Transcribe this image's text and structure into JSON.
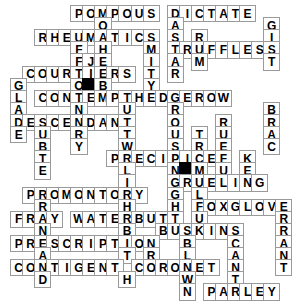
{
  "puzzle": {
    "title": "Crossword Grid",
    "columns": 16,
    "rows": 17,
    "cell_size": 17.3,
    "origin_x": 15,
    "origin_y": 10,
    "colors": {
      "cell_fill": "#ffffff",
      "cell_border": "#9a9a9a",
      "block_fill": "#000000",
      "letter": "#000000",
      "page_background": "#ffffff"
    },
    "across_entries": [
      {
        "answer": "POMPOUS",
        "row": 0,
        "col": 5
      },
      {
        "answer": "DICTATE",
        "row": 0,
        "col": 9
      },
      {
        "answer": "RHEUMATICS",
        "row": 2,
        "col": 2
      },
      {
        "answer": "TRUFFLES",
        "row": 4,
        "col": 9
      },
      {
        "answer": "COURTIERS",
        "row": 6,
        "col": 1
      },
      {
        "answer": "HEDGEROW",
        "row": 7,
        "col": 8
      },
      {
        "answer": "CONTEMPT",
        "row": 8,
        "col": 2
      },
      {
        "answer": "DESCENDANT",
        "row": 10,
        "col": 0
      },
      {
        "answer": "PRECIPICE",
        "row": 11,
        "col": 6
      },
      {
        "answer": "GRUELING",
        "row": 13,
        "col": 10
      },
      {
        "answer": "PROMONTORY",
        "row": 14,
        "col": 1
      },
      {
        "answer": "FOXGLOVE",
        "row": 15,
        "col": 8
      },
      {
        "answer": "FRAY",
        "row": 16,
        "col": 0
      },
      {
        "answer": "WATERBUTT",
        "row": 16,
        "col": 5
      },
      {
        "answer": "BUSKINS",
        "row": 17,
        "col": 6
      },
      {
        "answer": "PRESCRIPTION",
        "row": 18,
        "col": 0
      },
      {
        "answer": "CONTIGENT",
        "row": 20,
        "col": 0
      },
      {
        "answer": "CORONET",
        "row": 20,
        "col": 9
      },
      {
        "answer": "PARLEY",
        "row": 22,
        "col": 11
      }
    ],
    "down_entries": [
      {
        "answer": "POTHERS",
        "row": 0,
        "col": 6
      },
      {
        "answer": "DASTARD",
        "row": 0,
        "col": 9
      },
      {
        "answer": "FFORT",
        "row": 2,
        "col": 5
      },
      {
        "answer": "GIST",
        "row": 2,
        "col": 16
      },
      {
        "answer": "JET",
        "row": 4,
        "col": 7
      },
      {
        "answer": "ROUSTABOUT",
        "row": 3,
        "col": 11
      },
      {
        "answer": "GLADE",
        "row": 7,
        "col": 0
      },
      {
        "answer": "BRACKEN",
        "row": 9,
        "col": 16
      },
      {
        "answer": "TREMULOUS",
        "row": 10,
        "col": 12
      },
      {
        "answer": "RUEFUL",
        "row": 10,
        "col": 14
      },
      {
        "answer": "LIGHT",
        "row": 11,
        "col": 7
      },
      {
        "answer": "PROMONTORY",
        "row": 12,
        "col": 2
      },
      {
        "answer": "INHABITED",
        "row": 13,
        "col": 9
      },
      {
        "answer": "BLOWN",
        "row": 18,
        "col": 12
      },
      {
        "answer": "SCANTY",
        "row": 17,
        "col": 13
      },
      {
        "answer": "ERRANT",
        "row": 15,
        "col": 16
      }
    ],
    "cells": [
      {
        "r": 0,
        "c": 5,
        "t": "P"
      },
      {
        "r": 0,
        "c": 6,
        "t": "O"
      },
      {
        "r": 0,
        "c": 7,
        "t": "M"
      },
      {
        "r": 0,
        "c": 8,
        "t": "P"
      },
      {
        "r": 0,
        "c": 9,
        "t": "O"
      },
      {
        "r": 0,
        "c": 10,
        "t": "U"
      },
      {
        "r": 0,
        "c": 11,
        "t": "S"
      },
      {
        "r": 0,
        "c": 13,
        "t": "D"
      },
      {
        "r": 0,
        "c": 14,
        "t": "I"
      },
      {
        "r": 0,
        "c": 15,
        "t": "C"
      },
      {
        "r": 0,
        "c": 16,
        "t": "T"
      },
      {
        "r": 0,
        "c": 17,
        "t": "A"
      },
      {
        "r": 0,
        "c": 18,
        "t": "T"
      },
      {
        "r": 0,
        "c": 19,
        "t": "E"
      },
      {
        "r": 1,
        "c": 7,
        "t": "O"
      },
      {
        "r": 1,
        "c": 13,
        "t": "A"
      },
      {
        "r": 1,
        "c": 21,
        "t": "G"
      },
      {
        "r": 2,
        "c": 2,
        "t": "R"
      },
      {
        "r": 2,
        "c": 3,
        "t": "H"
      },
      {
        "r": 2,
        "c": 4,
        "t": "E"
      },
      {
        "r": 2,
        "c": 5,
        "t": "U"
      },
      {
        "r": 2,
        "c": 6,
        "t": "M"
      },
      {
        "r": 2,
        "c": 7,
        "t": "A"
      },
      {
        "r": 2,
        "c": 8,
        "t": "T"
      },
      {
        "r": 2,
        "c": 9,
        "t": "I"
      },
      {
        "r": 2,
        "c": 10,
        "t": "C"
      },
      {
        "r": 2,
        "c": 11,
        "t": "S"
      },
      {
        "r": 2,
        "c": 13,
        "t": "S"
      },
      {
        "r": 2,
        "c": 15,
        "t": "R"
      },
      {
        "r": 2,
        "c": 21,
        "t": "I"
      },
      {
        "r": 3,
        "c": 5,
        "t": "F"
      },
      {
        "r": 3,
        "c": 7,
        "t": "H"
      },
      {
        "r": 3,
        "c": 11,
        "t": "M"
      },
      {
        "r": 3,
        "c": 13,
        "t": "T"
      },
      {
        "r": 3,
        "c": 14,
        "t": "R"
      },
      {
        "r": 3,
        "c": 15,
        "t": "U"
      },
      {
        "r": 3,
        "c": 16,
        "t": "F"
      },
      {
        "r": 3,
        "c": 17,
        "t": "F"
      },
      {
        "r": 3,
        "c": 18,
        "t": "L"
      },
      {
        "r": 3,
        "c": 19,
        "t": "E"
      },
      {
        "r": 3,
        "c": 20,
        "t": "S"
      },
      {
        "r": 3,
        "c": 21,
        "t": "S"
      },
      {
        "r": 4,
        "c": 5,
        "t": "F"
      },
      {
        "r": 4,
        "c": 6,
        "t": "J"
      },
      {
        "r": 4,
        "c": 7,
        "t": "E"
      },
      {
        "r": 4,
        "c": 11,
        "t": "I"
      },
      {
        "r": 4,
        "c": 13,
        "t": "A"
      },
      {
        "r": 4,
        "c": 15,
        "t": "M"
      },
      {
        "r": 4,
        "c": 21,
        "t": "T"
      },
      {
        "r": 5,
        "c": 1,
        "t": "C"
      },
      {
        "r": 5,
        "c": 2,
        "t": "O"
      },
      {
        "r": 5,
        "c": 3,
        "t": "U"
      },
      {
        "r": 5,
        "c": 4,
        "t": "R"
      },
      {
        "r": 5,
        "c": 5,
        "t": "T"
      },
      {
        "r": 5,
        "c": 6,
        "t": "I"
      },
      {
        "r": 5,
        "c": 7,
        "t": "E"
      },
      {
        "r": 5,
        "c": 8,
        "t": "R"
      },
      {
        "r": 5,
        "c": 9,
        "t": "S"
      },
      {
        "r": 5,
        "c": 11,
        "t": "T"
      },
      {
        "r": 5,
        "c": 13,
        "t": "R"
      },
      {
        "r": 6,
        "c": 0,
        "t": "G"
      },
      {
        "r": 6,
        "c": 5,
        "t": "O"
      },
      {
        "r": 6,
        "c": 6,
        "t": "",
        "block": true
      },
      {
        "r": 6,
        "c": 7,
        "t": "B"
      },
      {
        "r": 6,
        "c": 11,
        "t": "Y"
      },
      {
        "r": 7,
        "c": 0,
        "t": "L"
      },
      {
        "r": 7,
        "c": 2,
        "t": "C"
      },
      {
        "r": 7,
        "c": 3,
        "t": "O"
      },
      {
        "r": 7,
        "c": 4,
        "t": "N"
      },
      {
        "r": 7,
        "c": 5,
        "t": "T"
      },
      {
        "r": 7,
        "c": 6,
        "t": "E"
      },
      {
        "r": 7,
        "c": 7,
        "t": "M"
      },
      {
        "r": 7,
        "c": 8,
        "t": "P"
      },
      {
        "r": 7,
        "c": 9,
        "t": "T"
      },
      {
        "r": 7,
        "c": 10,
        "t": "H"
      },
      {
        "r": 7,
        "c": 11,
        "t": "E"
      },
      {
        "r": 7,
        "c": 12,
        "t": "D"
      },
      {
        "r": 7,
        "c": 13,
        "t": "G"
      },
      {
        "r": 7,
        "c": 14,
        "t": "E"
      },
      {
        "r": 7,
        "c": 15,
        "t": "R"
      },
      {
        "r": 7,
        "c": 16,
        "t": "O"
      },
      {
        "r": 7,
        "c": 17,
        "t": "W"
      },
      {
        "r": 8,
        "c": 0,
        "t": "A"
      },
      {
        "r": 8,
        "c": 5,
        "t": "N"
      },
      {
        "r": 8,
        "c": 9,
        "t": "U"
      },
      {
        "r": 8,
        "c": 13,
        "t": "R"
      },
      {
        "r": 8,
        "c": 21,
        "t": "B"
      },
      {
        "r": 9,
        "c": 0,
        "t": "D"
      },
      {
        "r": 9,
        "c": 1,
        "t": "E"
      },
      {
        "r": 9,
        "c": 2,
        "t": "S"
      },
      {
        "r": 9,
        "c": 3,
        "t": "C"
      },
      {
        "r": 9,
        "c": 4,
        "t": "E"
      },
      {
        "r": 9,
        "c": 5,
        "t": "N"
      },
      {
        "r": 9,
        "c": 6,
        "t": "D"
      },
      {
        "r": 9,
        "c": 7,
        "t": "A"
      },
      {
        "r": 9,
        "c": 8,
        "t": "N"
      },
      {
        "r": 9,
        "c": 9,
        "t": "T"
      },
      {
        "r": 9,
        "c": 13,
        "t": "O"
      },
      {
        "r": 9,
        "c": 17,
        "t": "R"
      },
      {
        "r": 9,
        "c": 21,
        "t": "R"
      },
      {
        "r": 10,
        "c": 0,
        "t": "E"
      },
      {
        "r": 10,
        "c": 2,
        "t": "U"
      },
      {
        "r": 10,
        "c": 5,
        "t": "R"
      },
      {
        "r": 10,
        "c": 9,
        "t": "T"
      },
      {
        "r": 10,
        "c": 13,
        "t": "U"
      },
      {
        "r": 10,
        "c": 15,
        "t": "T"
      },
      {
        "r": 10,
        "c": 17,
        "t": "U"
      },
      {
        "r": 10,
        "c": 21,
        "t": "A"
      },
      {
        "r": 11,
        "c": 2,
        "t": "B"
      },
      {
        "r": 11,
        "c": 5,
        "t": "Y"
      },
      {
        "r": 11,
        "c": 9,
        "t": "W"
      },
      {
        "r": 11,
        "c": 13,
        "t": "S"
      },
      {
        "r": 11,
        "c": 15,
        "t": "R"
      },
      {
        "r": 11,
        "c": 17,
        "t": "E"
      },
      {
        "r": 11,
        "c": 21,
        "t": "C"
      },
      {
        "r": 12,
        "c": 2,
        "t": "T"
      },
      {
        "r": 12,
        "c": 8,
        "t": "P"
      },
      {
        "r": 12,
        "c": 9,
        "t": "R"
      },
      {
        "r": 12,
        "c": 10,
        "t": "E"
      },
      {
        "r": 12,
        "c": 11,
        "t": "C"
      },
      {
        "r": 12,
        "c": 12,
        "t": "I"
      },
      {
        "r": 12,
        "c": 13,
        "t": "P"
      },
      {
        "r": 12,
        "c": 14,
        "t": "I"
      },
      {
        "r": 12,
        "c": 15,
        "t": "C"
      },
      {
        "r": 12,
        "c": 16,
        "t": "E"
      },
      {
        "r": 12,
        "c": 17,
        "t": "F"
      },
      {
        "r": 12,
        "c": 19,
        "t": "K"
      },
      {
        "r": 13,
        "c": 2,
        "t": "E"
      },
      {
        "r": 13,
        "c": 9,
        "t": "L"
      },
      {
        "r": 13,
        "c": 13,
        "t": "N"
      },
      {
        "r": 13,
        "c": 14,
        "t": "",
        "block": true
      },
      {
        "r": 13,
        "c": 15,
        "t": "M"
      },
      {
        "r": 13,
        "c": 17,
        "t": "U"
      },
      {
        "r": 13,
        "c": 19,
        "t": "E"
      },
      {
        "r": 14,
        "c": 9,
        "t": "I"
      },
      {
        "r": 14,
        "c": 13,
        "t": "G"
      },
      {
        "r": 14,
        "c": 14,
        "t": "R"
      },
      {
        "r": 14,
        "c": 15,
        "t": "U"
      },
      {
        "r": 14,
        "c": 16,
        "t": "E"
      },
      {
        "r": 14,
        "c": 17,
        "t": "L"
      },
      {
        "r": 14,
        "c": 18,
        "t": "I"
      },
      {
        "r": 14,
        "c": 19,
        "t": "N"
      },
      {
        "r": 14,
        "c": 20,
        "t": "G"
      },
      {
        "r": 15,
        "c": 1,
        "t": "P"
      },
      {
        "r": 15,
        "c": 2,
        "t": "R"
      },
      {
        "r": 15,
        "c": 3,
        "t": "O"
      },
      {
        "r": 15,
        "c": 4,
        "t": "M"
      },
      {
        "r": 15,
        "c": 5,
        "t": "O"
      },
      {
        "r": 15,
        "c": 6,
        "t": "N"
      },
      {
        "r": 15,
        "c": 7,
        "t": "T"
      },
      {
        "r": 15,
        "c": 8,
        "t": "O"
      },
      {
        "r": 15,
        "c": 9,
        "t": "R"
      },
      {
        "r": 15,
        "c": 10,
        "t": "Y"
      },
      {
        "r": 15,
        "c": 13,
        "t": "G"
      },
      {
        "r": 15,
        "c": 15,
        "t": "L"
      },
      {
        "r": 16,
        "c": 2,
        "t": "R"
      },
      {
        "r": 16,
        "c": 9,
        "t": "H"
      },
      {
        "r": 16,
        "c": 13,
        "t": "H"
      },
      {
        "r": 16,
        "c": 15,
        "t": "F"
      },
      {
        "r": 16,
        "c": 16,
        "t": "O"
      },
      {
        "r": 16,
        "c": 17,
        "t": "X"
      },
      {
        "r": 16,
        "c": 18,
        "t": "G"
      },
      {
        "r": 16,
        "c": 19,
        "t": "L"
      },
      {
        "r": 16,
        "c": 20,
        "t": "O"
      },
      {
        "r": 16,
        "c": 21,
        "t": "V"
      },
      {
        "r": 16,
        "c": 22,
        "t": "E"
      },
      {
        "r": 17,
        "c": 0,
        "t": "F"
      },
      {
        "r": 17,
        "c": 1,
        "t": "R"
      },
      {
        "r": 17,
        "c": 2,
        "t": "A"
      },
      {
        "r": 17,
        "c": 3,
        "t": "Y"
      },
      {
        "r": 17,
        "c": 5,
        "t": "W"
      },
      {
        "r": 17,
        "c": 6,
        "t": "A"
      },
      {
        "r": 17,
        "c": 7,
        "t": "T"
      },
      {
        "r": 17,
        "c": 8,
        "t": "E"
      },
      {
        "r": 17,
        "c": 9,
        "t": "R"
      },
      {
        "r": 17,
        "c": 10,
        "t": "B"
      },
      {
        "r": 17,
        "c": 11,
        "t": "U"
      },
      {
        "r": 17,
        "c": 12,
        "t": "T"
      },
      {
        "r": 17,
        "c": 13,
        "t": "T"
      },
      {
        "r": 17,
        "c": 15,
        "t": "U"
      },
      {
        "r": 17,
        "c": 22,
        "t": "R"
      },
      {
        "r": 18,
        "c": 2,
        "t": "N"
      },
      {
        "r": 18,
        "c": 9,
        "t": "B"
      },
      {
        "r": 18,
        "c": 12,
        "t": "B"
      },
      {
        "r": 18,
        "c": 13,
        "t": "U"
      },
      {
        "r": 18,
        "c": 14,
        "t": "S"
      },
      {
        "r": 18,
        "c": 15,
        "t": "K"
      },
      {
        "r": 18,
        "c": 16,
        "t": "I"
      },
      {
        "r": 18,
        "c": 17,
        "t": "N"
      },
      {
        "r": 18,
        "c": 18,
        "t": "S"
      },
      {
        "r": 18,
        "c": 22,
        "t": "R"
      },
      {
        "r": 19,
        "c": 0,
        "t": "P"
      },
      {
        "r": 19,
        "c": 1,
        "t": "R"
      },
      {
        "r": 19,
        "c": 2,
        "t": "E"
      },
      {
        "r": 19,
        "c": 3,
        "t": "S"
      },
      {
        "r": 19,
        "c": 4,
        "t": "C"
      },
      {
        "r": 19,
        "c": 5,
        "t": "R"
      },
      {
        "r": 19,
        "c": 6,
        "t": "I"
      },
      {
        "r": 19,
        "c": 7,
        "t": "P"
      },
      {
        "r": 19,
        "c": 8,
        "t": "T"
      },
      {
        "r": 19,
        "c": 9,
        "t": "I"
      },
      {
        "r": 19,
        "c": 10,
        "t": "O"
      },
      {
        "r": 19,
        "c": 11,
        "t": "N"
      },
      {
        "r": 19,
        "c": 14,
        "t": "B"
      },
      {
        "r": 19,
        "c": 18,
        "t": "C"
      },
      {
        "r": 19,
        "c": 22,
        "t": "A"
      },
      {
        "r": 20,
        "c": 2,
        "t": "A"
      },
      {
        "r": 20,
        "c": 9,
        "t": "T"
      },
      {
        "r": 20,
        "c": 11,
        "t": "R"
      },
      {
        "r": 20,
        "c": 14,
        "t": "L"
      },
      {
        "r": 20,
        "c": 18,
        "t": "A"
      },
      {
        "r": 20,
        "c": 22,
        "t": "N"
      },
      {
        "r": 21,
        "c": 0,
        "t": "C"
      },
      {
        "r": 21,
        "c": 1,
        "t": "O"
      },
      {
        "r": 21,
        "c": 2,
        "t": "N"
      },
      {
        "r": 21,
        "c": 3,
        "t": "T"
      },
      {
        "r": 21,
        "c": 4,
        "t": "I"
      },
      {
        "r": 21,
        "c": 5,
        "t": "G"
      },
      {
        "r": 21,
        "c": 6,
        "t": "E"
      },
      {
        "r": 21,
        "c": 7,
        "t": "N"
      },
      {
        "r": 21,
        "c": 8,
        "t": "T"
      },
      {
        "r": 21,
        "c": 10,
        "t": "C"
      },
      {
        "r": 21,
        "c": 11,
        "t": "O"
      },
      {
        "r": 21,
        "c": 12,
        "t": "R"
      },
      {
        "r": 21,
        "c": 13,
        "t": "O"
      },
      {
        "r": 21,
        "c": 14,
        "t": "N"
      },
      {
        "r": 21,
        "c": 15,
        "t": "E"
      },
      {
        "r": 21,
        "c": 16,
        "t": "T"
      },
      {
        "r": 21,
        "c": 18,
        "t": "N"
      },
      {
        "r": 21,
        "c": 22,
        "t": "T"
      },
      {
        "r": 22,
        "c": 2,
        "t": "D"
      },
      {
        "r": 22,
        "c": 9,
        "t": "H"
      },
      {
        "r": 22,
        "c": 14,
        "t": "W"
      },
      {
        "r": 22,
        "c": 18,
        "t": "T"
      },
      {
        "r": 23,
        "c": 14,
        "t": "N"
      },
      {
        "r": 23,
        "c": 16,
        "t": "P"
      },
      {
        "r": 23,
        "c": 17,
        "t": "A"
      },
      {
        "r": 23,
        "c": 18,
        "t": "R"
      },
      {
        "r": 23,
        "c": 19,
        "t": "L"
      },
      {
        "r": 23,
        "c": 20,
        "t": "E"
      },
      {
        "r": 23,
        "c": 21,
        "t": "Y"
      }
    ]
  }
}
